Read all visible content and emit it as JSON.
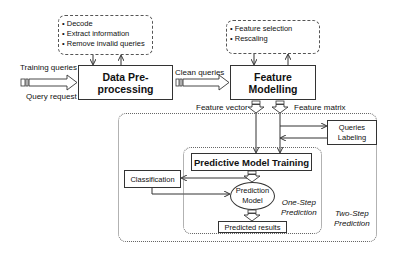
{
  "diagram": {
    "preprocessing_notes": [
      "Decode",
      "Extract information",
      "Remove invalid queries"
    ],
    "feature_notes": [
      "Feature selection",
      "Rescaling"
    ],
    "inputs": {
      "top": "Training queries",
      "bottom": "Query request"
    },
    "nodes": {
      "data_preprocessing": "Data Pre-processing",
      "feature_modelling": "Feature Modelling",
      "predictive_training": "Predictive Model Training",
      "queries_labeling": [
        "Queries",
        "Labeling"
      ],
      "classification": "Classification",
      "prediction_model": [
        "Prediction",
        "Model"
      ],
      "predicted_results": "Predicted results"
    },
    "edge_labels": {
      "clean_queries": "Clean queries",
      "feature_vector": "Feature vector",
      "feature_matrix": "Feature matrix"
    },
    "regions": {
      "one_step": [
        "One-Step",
        "Prediction"
      ],
      "two_step": [
        "Two-Step",
        "Prediction"
      ]
    },
    "colors": {
      "line": "#333333",
      "border": "#555555",
      "background": "#ffffff"
    }
  }
}
